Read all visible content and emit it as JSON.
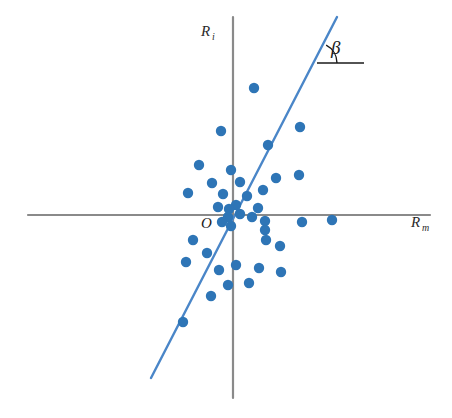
{
  "chart_data": {
    "type": "scatter",
    "title": "",
    "subtitle": "",
    "xlabel": "R_m",
    "ylabel": "R_i",
    "xlabel_base": "R",
    "xlabel_sub": "m",
    "ylabel_base": "R",
    "ylabel_sub": "i",
    "origin_label": "O",
    "angle_label": "β",
    "grid": false,
    "legend": null,
    "axis_style": {
      "color": "#8a8a8a",
      "line_width": 2.2,
      "origin_px": [
        233,
        215
      ],
      "x_axis_px": [
        28,
        215,
        430,
        215
      ],
      "y_axis_px": [
        233,
        17,
        233,
        398
      ],
      "xlim_px": [
        28,
        430
      ],
      "ylim_px": [
        17,
        398
      ]
    },
    "regression_line": {
      "name": "security characteristic line",
      "color": "#4a86c8",
      "line_width": 2.4,
      "start_px": [
        151,
        378
      ],
      "end_px": [
        337,
        17
      ],
      "slope_label": "β",
      "passes_through_origin": true
    },
    "angle_marker": {
      "label": "β",
      "color": "#1a1a1a",
      "vertex_px": [
        317,
        63
      ],
      "ray_end_px": [
        364,
        63
      ],
      "arc_radius_px": 20,
      "label_px": [
        331,
        48
      ]
    },
    "point_style": {
      "color": "#2e75b6",
      "radius_px": 5.2,
      "marker": "circle"
    },
    "n_points": 40,
    "points_px": [
      [
        254,
        88
      ],
      [
        221,
        131
      ],
      [
        300,
        127
      ],
      [
        199,
        165
      ],
      [
        268,
        145
      ],
      [
        240,
        182
      ],
      [
        188,
        193
      ],
      [
        276,
        178
      ],
      [
        299,
        175
      ],
      [
        212,
        183
      ],
      [
        231,
        170
      ],
      [
        223,
        194
      ],
      [
        247,
        196
      ],
      [
        263,
        190
      ],
      [
        236,
        205
      ],
      [
        218,
        207
      ],
      [
        229,
        209
      ],
      [
        228,
        217
      ],
      [
        240,
        214
      ],
      [
        252,
        217
      ],
      [
        258,
        208
      ],
      [
        265,
        221
      ],
      [
        222,
        222
      ],
      [
        231,
        226
      ],
      [
        265,
        230
      ],
      [
        266,
        240
      ],
      [
        302,
        222
      ],
      [
        332,
        220
      ],
      [
        193,
        240
      ],
      [
        280,
        246
      ],
      [
        207,
        253
      ],
      [
        236,
        265
      ],
      [
        219,
        270
      ],
      [
        186,
        262
      ],
      [
        259,
        268
      ],
      [
        281,
        272
      ],
      [
        228,
        285
      ],
      [
        249,
        283
      ],
      [
        211,
        296
      ],
      [
        183,
        322
      ]
    ]
  },
  "meta": {
    "background": "#ffffff",
    "axis_color": "#8a8a8a",
    "point_color": "#2e75b6",
    "line_color": "#4a86c8",
    "text_color": "#1a1a1a"
  }
}
